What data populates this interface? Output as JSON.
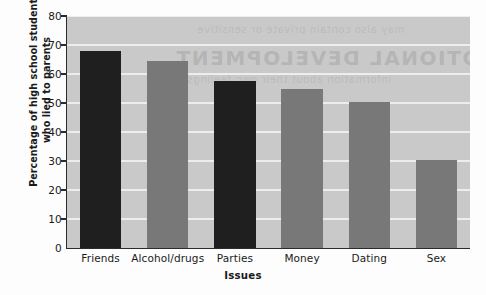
{
  "chart_data": {
    "type": "bar",
    "title": "",
    "subtitle": "",
    "xlabel": "Issues",
    "ylabel": "Percentage of high school students who lied to parents",
    "ylabel_lines": [
      "Percentage of high school students",
      "who lied to parents"
    ],
    "categories": [
      "Friends",
      "Alcohol/drugs",
      "Parties",
      "Money",
      "Dating",
      "Sex"
    ],
    "values": [
      68,
      64.5,
      57.5,
      55,
      50.5,
      30.5
    ],
    "bar_colors": [
      "#1f1f1f",
      "#787878",
      "#1f1f1f",
      "#787878",
      "#787878",
      "#787878"
    ],
    "ylim": [
      0,
      80
    ],
    "yticks": [
      0,
      10,
      20,
      30,
      40,
      50,
      60,
      70,
      80
    ],
    "ytick_labels": [
      "0",
      "10",
      "20",
      "30",
      "40",
      "50",
      "60",
      "70",
      "80"
    ],
    "grid": true,
    "gridline_color": "#ededed",
    "plot_background": "#c9c9c9",
    "figure_background": "#fdfdfd",
    "axis_color": "#2b2b2b",
    "legend": null,
    "legend_position": "none"
  },
  "watermark": {
    "main": "ALL EMOTIONAL DEVELOPMENT",
    "line2": "may also contain private or sensitive",
    "line3": "information about their own feelings"
  }
}
